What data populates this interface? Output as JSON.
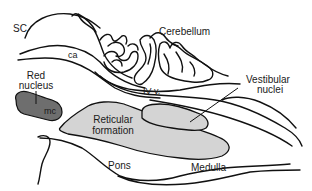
{
  "diagram": {
    "type": "anatomical-sagittal-section",
    "labels": {
      "sc": "SC",
      "ca": "ca",
      "cerebellum": "Cerebellum",
      "red_nucleus_line1": "Red",
      "red_nucleus_line2": "nucleus",
      "mc": "mc",
      "fourth_ventricle": "IV v.",
      "vestibular_line1": "Vestibular",
      "vestibular_line2": "nuclei",
      "reticular_line1": "Reticular",
      "reticular_line2": "formation",
      "pons": "Pons",
      "medulla": "Medulla"
    },
    "colors": {
      "outline": "#111111",
      "red_nucleus_fill": "#6e6e6e",
      "reticular_fill": "#d4d4d4",
      "vestibular_fill": "#d4d4d4",
      "background": "#ffffff"
    }
  }
}
